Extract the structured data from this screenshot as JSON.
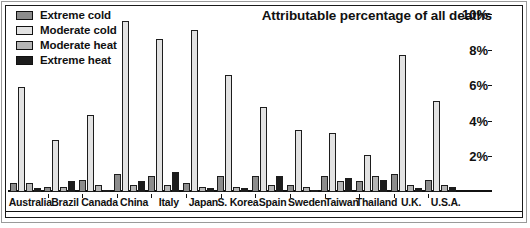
{
  "chart_data": {
    "type": "bar",
    "title": "Attributable percentage of all deaths",
    "xlabel": "",
    "ylabel": "",
    "ylim": [
      0,
      10
    ],
    "ytick_values": [
      10,
      8,
      6,
      4,
      2
    ],
    "ytick_labels": [
      "10%",
      "8%",
      "6%",
      "4%",
      "2%"
    ],
    "grid": false,
    "legend_position": "top-left",
    "categories": [
      "Australia",
      "Brazil",
      "Canada",
      "China",
      "Italy",
      "Japan",
      "S. Korea",
      "Spain",
      "Sweden",
      "Taiwan",
      "Thailand",
      "U.K.",
      "U.S.A."
    ],
    "series": [
      {
        "name": "Extreme cold",
        "color": "#8c8c8c",
        "values": [
          0.5,
          0.3,
          0.7,
          1.0,
          0.9,
          0.5,
          0.9,
          0.9,
          0.4,
          0.9,
          0.6,
          1.0,
          0.7
        ]
      },
      {
        "name": "Moderate cold",
        "color": "#e2e2e2",
        "values": [
          5.9,
          2.9,
          4.3,
          9.6,
          8.6,
          9.1,
          6.6,
          4.8,
          3.5,
          3.3,
          2.1,
          7.7,
          5.1
        ]
      },
      {
        "name": "Moderate heat",
        "color": "#b5b5b5",
        "values": [
          0.5,
          0.3,
          0.4,
          0.4,
          0.4,
          0.3,
          0.3,
          0.4,
          0.3,
          0.6,
          0.9,
          0.4,
          0.4
        ]
      },
      {
        "name": "Extreme heat",
        "color": "#1c1c1c",
        "values": [
          0.2,
          0.6,
          0.1,
          0.6,
          1.1,
          0.2,
          0.2,
          0.9,
          0.1,
          0.8,
          0.7,
          0.2,
          0.3
        ]
      }
    ]
  },
  "legend": {
    "items": [
      {
        "label": "Extreme cold",
        "color": "#8c8c8c"
      },
      {
        "label": "Moderate cold",
        "color": "#e2e2e2"
      },
      {
        "label": "Moderate heat",
        "color": "#b5b5b5"
      },
      {
        "label": "Extreme heat",
        "color": "#1c1c1c"
      }
    ]
  }
}
